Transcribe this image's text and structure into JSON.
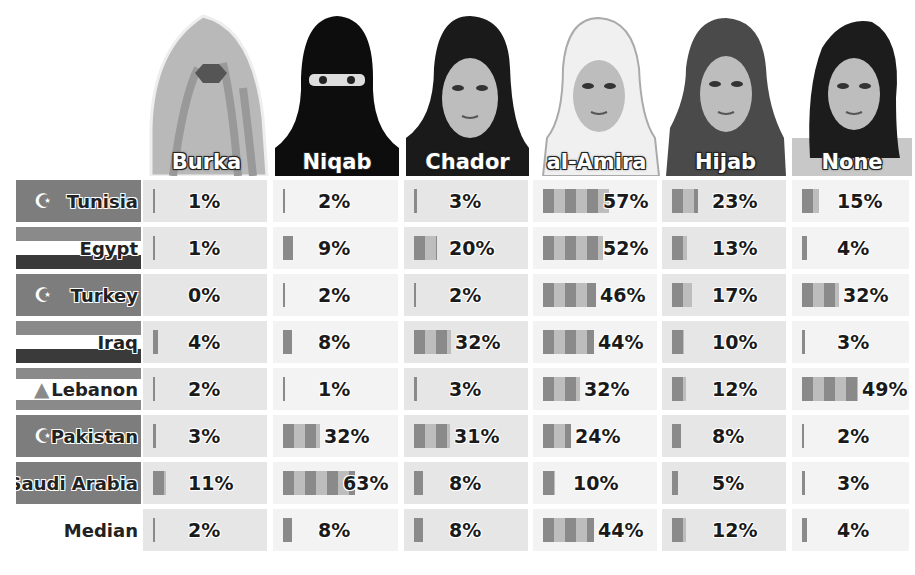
{
  "chart_data": {
    "type": "table",
    "title": "",
    "columns": [
      "Burka",
      "Niqab",
      "Chador",
      "al-Amira",
      "Hijab",
      "None"
    ],
    "rows": [
      {
        "country": "Tunisia",
        "values": [
          1,
          2,
          3,
          57,
          23,
          15
        ]
      },
      {
        "country": "Egypt",
        "values": [
          1,
          9,
          20,
          52,
          13,
          4
        ]
      },
      {
        "country": "Turkey",
        "values": [
          0,
          2,
          2,
          46,
          17,
          32
        ]
      },
      {
        "country": "Iraq",
        "values": [
          4,
          8,
          32,
          44,
          10,
          3
        ]
      },
      {
        "country": "Lebanon",
        "values": [
          2,
          1,
          3,
          32,
          12,
          49
        ]
      },
      {
        "country": "Pakistan",
        "values": [
          3,
          32,
          31,
          24,
          8,
          2
        ]
      },
      {
        "country": "Saudi Arabia",
        "values": [
          11,
          63,
          8,
          10,
          5,
          3
        ]
      },
      {
        "country": "Median",
        "values": [
          2,
          8,
          8,
          44,
          12,
          4
        ]
      }
    ],
    "unit": "%",
    "inline_bars": true
  },
  "header": {
    "columns": [
      {
        "label": "Burka",
        "icon": "burka-portrait-icon"
      },
      {
        "label": "Niqab",
        "icon": "niqab-portrait-icon"
      },
      {
        "label": "Chador",
        "icon": "chador-portrait-icon"
      },
      {
        "label": "al-Amira",
        "icon": "al-amira-portrait-icon"
      },
      {
        "label": "Hijab",
        "icon": "hijab-portrait-icon"
      },
      {
        "label": "None",
        "icon": "no-veil-portrait-icon"
      }
    ]
  },
  "rows": [
    {
      "label": "Tunisia",
      "flag": "tunisia-flag-icon",
      "cells": [
        "1%",
        "2%",
        "3%",
        "57%",
        "23%",
        "15%"
      ]
    },
    {
      "label": "Egypt",
      "flag": "egypt-flag-icon",
      "cells": [
        "1%",
        "9%",
        "20%",
        "52%",
        "13%",
        "4%"
      ]
    },
    {
      "label": "Turkey",
      "flag": "turkey-flag-icon",
      "cells": [
        "0%",
        "2%",
        "2%",
        "46%",
        "17%",
        "32%"
      ]
    },
    {
      "label": "Iraq",
      "flag": "iraq-flag-icon",
      "cells": [
        "4%",
        "8%",
        "32%",
        "44%",
        "10%",
        "3%"
      ]
    },
    {
      "label": "Lebanon",
      "flag": "lebanon-flag-icon",
      "cells": [
        "2%",
        "1%",
        "3%",
        "32%",
        "12%",
        "49%"
      ]
    },
    {
      "label": "Pakistan",
      "flag": "pakistan-flag-icon",
      "cells": [
        "3%",
        "32%",
        "31%",
        "24%",
        "8%",
        "2%"
      ]
    },
    {
      "label": "Saudi Arabia",
      "flag": "saudi-arabia-flag-icon",
      "cells": [
        "11%",
        "63%",
        "8%",
        "10%",
        "5%",
        "3%"
      ]
    },
    {
      "label": "Median",
      "flag": "",
      "cells": [
        "2%",
        "8%",
        "8%",
        "44%",
        "12%",
        "4%"
      ]
    }
  ],
  "colors": {
    "bar_dark": "#8a8a8a",
    "bar_light": "#bdbdbd",
    "cell_shade": "#e6e6e6",
    "cell_light": "#f3f3f3",
    "flag_gray": "#7d7d7d"
  }
}
